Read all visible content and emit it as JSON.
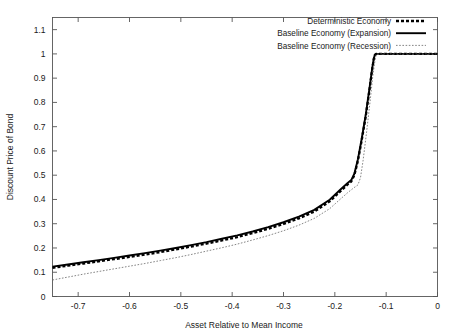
{
  "chart_data": {
    "type": "line",
    "title": "",
    "xlabel": "Asset Relative to Mean Income",
    "ylabel": "Discount Price of Bond",
    "xlim": [
      -0.75,
      0
    ],
    "ylim": [
      0,
      1.15
    ],
    "grid": false,
    "legend_position": "top-right",
    "xticks": [
      -0.7,
      -0.6,
      -0.5,
      -0.4,
      -0.3,
      -0.2,
      -0.1,
      0
    ],
    "xticklabels": [
      "-0.7",
      "-0.6",
      "-0.5",
      "-0.4",
      "-0.3",
      "-0.2",
      "-0.1",
      "0"
    ],
    "yticks": [
      0,
      0.1,
      0.2,
      0.3,
      0.4,
      0.5,
      0.6,
      0.7,
      0.8,
      0.9,
      1,
      1.1
    ],
    "yticklabels": [
      "0",
      "0.1",
      "0.2",
      "0.3",
      "0.4",
      "0.5",
      "0.6",
      "0.7",
      "0.8",
      "0.9",
      "1",
      "1.1"
    ],
    "series": [
      {
        "name": "Deterministic Economy",
        "style": "thick-dashed",
        "color": "#000000",
        "x": [
          -0.75,
          -0.72,
          -0.69,
          -0.66,
          -0.63,
          -0.6,
          -0.57,
          -0.54,
          -0.51,
          -0.48,
          -0.45,
          -0.42,
          -0.39,
          -0.36,
          -0.33,
          -0.3,
          -0.27,
          -0.24,
          -0.21,
          -0.19,
          -0.175,
          -0.168,
          -0.162,
          -0.155,
          -0.148,
          -0.14,
          -0.132,
          -0.127,
          -0.124,
          -0.122,
          -0.12,
          -0.1,
          -0.07,
          -0.04,
          0
        ],
        "y": [
          0.118,
          0.127,
          0.136,
          0.145,
          0.154,
          0.163,
          0.173,
          0.183,
          0.194,
          0.206,
          0.218,
          0.231,
          0.245,
          0.261,
          0.279,
          0.299,
          0.322,
          0.35,
          0.392,
          0.432,
          0.462,
          0.474,
          0.5,
          0.56,
          0.64,
          0.74,
          0.86,
          0.94,
          0.98,
          0.995,
          1.0,
          1.0,
          1.0,
          1.0,
          1.0
        ]
      },
      {
        "name": "Baseline Economy (Expansion)",
        "style": "thick-solid",
        "color": "#000000",
        "x": [
          -0.75,
          -0.72,
          -0.69,
          -0.66,
          -0.63,
          -0.6,
          -0.57,
          -0.54,
          -0.51,
          -0.48,
          -0.45,
          -0.42,
          -0.39,
          -0.36,
          -0.33,
          -0.3,
          -0.27,
          -0.24,
          -0.21,
          -0.19,
          -0.175,
          -0.168,
          -0.162,
          -0.155,
          -0.148,
          -0.14,
          -0.132,
          -0.127,
          -0.124,
          -0.122,
          -0.12,
          -0.1,
          -0.07,
          -0.04,
          0
        ],
        "y": [
          0.123,
          0.132,
          0.141,
          0.15,
          0.159,
          0.169,
          0.179,
          0.189,
          0.2,
          0.212,
          0.224,
          0.238,
          0.252,
          0.268,
          0.286,
          0.306,
          0.329,
          0.357,
          0.399,
          0.439,
          0.468,
          0.48,
          0.506,
          0.566,
          0.646,
          0.746,
          0.866,
          0.944,
          0.982,
          0.996,
          1.0,
          1.0,
          1.0,
          1.0,
          1.0
        ]
      },
      {
        "name": "Baseline Economy (Recession)",
        "style": "thin-dotted",
        "color": "#666666",
        "x": [
          -0.75,
          -0.72,
          -0.69,
          -0.66,
          -0.63,
          -0.6,
          -0.57,
          -0.54,
          -0.51,
          -0.48,
          -0.45,
          -0.42,
          -0.39,
          -0.36,
          -0.33,
          -0.3,
          -0.27,
          -0.24,
          -0.21,
          -0.19,
          -0.175,
          -0.163,
          -0.155,
          -0.15,
          -0.145,
          -0.138,
          -0.131,
          -0.126,
          -0.122,
          -0.12,
          -0.118,
          -0.1,
          -0.07,
          -0.04,
          0
        ],
        "y": [
          0.068,
          0.08,
          0.092,
          0.103,
          0.114,
          0.125,
          0.136,
          0.148,
          0.16,
          0.173,
          0.187,
          0.201,
          0.216,
          0.233,
          0.251,
          0.271,
          0.294,
          0.322,
          0.362,
          0.4,
          0.428,
          0.448,
          0.46,
          0.49,
          0.56,
          0.68,
          0.81,
          0.91,
          0.97,
          0.99,
          1.0,
          1.0,
          1.0,
          1.0,
          1.0
        ]
      }
    ]
  },
  "legend": {
    "entries": [
      {
        "label": "Deterministic Economy"
      },
      {
        "label": "Baseline Economy (Expansion)"
      },
      {
        "label": "Baseline Economy (Recession)"
      }
    ]
  }
}
